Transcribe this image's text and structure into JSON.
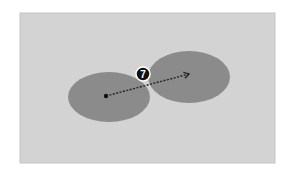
{
  "canvas": {
    "width": 289,
    "height": 180,
    "background": "#ffffff"
  },
  "panel": {
    "x": 20,
    "y": 13,
    "width": 255,
    "height": 150,
    "fill": "#d3d3d3",
    "stroke": "#c4c4c4"
  },
  "ellipses": [
    {
      "name": "left-ellipse",
      "cx": 109,
      "cy": 97,
      "rx": 41,
      "ry": 25,
      "fill": "#8b8b8b"
    },
    {
      "name": "right-ellipse",
      "cx": 189,
      "cy": 77,
      "rx": 41,
      "ry": 26,
      "fill": "#8b8b8b"
    }
  ],
  "arrow": {
    "x1": 106,
    "y1": 96,
    "x2": 189,
    "y2": 74,
    "color": "#222222",
    "style": "dotted"
  },
  "start_dot": {
    "cx": 106,
    "cy": 96,
    "r": 2.2,
    "fill": "#111111"
  },
  "marker": {
    "cx": 143,
    "cy": 74,
    "r": 7,
    "fill": "#111111",
    "stroke": "#ffffff",
    "label": "7",
    "label_color": "#ffffff"
  }
}
